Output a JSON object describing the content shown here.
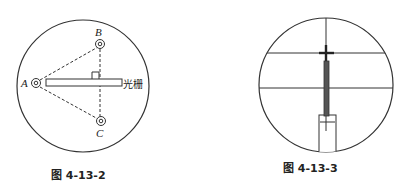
{
  "figures": [
    {
      "id": "fig-4-13-2",
      "caption": "图 4-13-2",
      "description": "Circular field of view with three target points A, B, C connected by dashed lines; a grating bar extends from A with a right-angle marker at the dashed line BC",
      "points": {
        "A": {
          "label": "A",
          "x": 36,
          "y": 83
        },
        "B": {
          "label": "B",
          "x": 100,
          "y": 44
        },
        "C": {
          "label": "C",
          "x": 101,
          "y": 121
        }
      },
      "grating_label": "光栅",
      "colors": {
        "stroke": "#333333",
        "background": "#ffffff"
      }
    },
    {
      "id": "fig-4-13-3",
      "caption": "图 4-13-3",
      "description": "Circular field of view with vertical reticle line, two horizontal lines, a cross mark at the upper line, a dark vertical rod and a rectangular base with a small cross",
      "colors": {
        "stroke": "#333333",
        "rod": "#555555",
        "background": "#ffffff"
      }
    }
  ]
}
